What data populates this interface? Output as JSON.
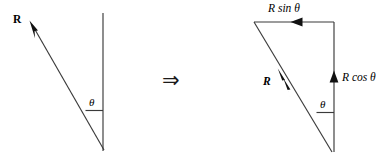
{
  "figure": {
    "background_color": "#ffffff",
    "line_color": "#3a3a3a",
    "text_color": "#000000",
    "operator": {
      "symbol": "⇒",
      "name": "implies-arrow"
    },
    "left_diagram": {
      "name": "resultant-vector-diagram",
      "labels": {
        "resultant": "R",
        "angle": "θ"
      },
      "geometry": {
        "vertical_line": {
          "x": 103,
          "y1": 13,
          "y2": 151
        },
        "resultant_vector": {
          "x1": 104,
          "y1": 150,
          "x2": 30,
          "y2": 21
        },
        "angle_tick": {
          "x1": 86,
          "y1": 110,
          "x2": 103,
          "y2": 110
        }
      }
    },
    "right_diagram": {
      "name": "component-resolution-diagram",
      "labels": {
        "horizontal_component": "R sin θ",
        "vertical_component": "R cos θ",
        "resultant": "R",
        "angle": "θ"
      },
      "geometry": {
        "top_line": {
          "x1": 254,
          "y1": 22,
          "x2": 334,
          "y2": 22
        },
        "vertical_line": {
          "x": 334,
          "y1": 22,
          "y2": 152
        },
        "resultant_vector": {
          "x1": 332,
          "y1": 152,
          "x2": 254,
          "y2": 22
        },
        "angle_tick": {
          "x1": 317,
          "y1": 112,
          "x2": 334,
          "y2": 112
        }
      }
    }
  }
}
